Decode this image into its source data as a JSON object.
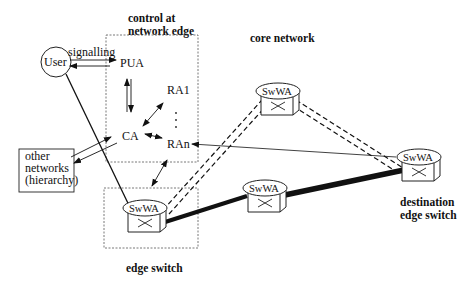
{
  "diagram": {
    "title_control": [
      "control at",
      "network edge"
    ],
    "core_label": "core network",
    "edge_switch_label": "edge switch",
    "destination_label": [
      "destination",
      "edge switch"
    ],
    "user": "User",
    "signalling": "signalling",
    "pua": "PUA",
    "ca": "CA",
    "ra1": "RA1",
    "ran": "RAn",
    "other_networks": [
      "other",
      "networks",
      "(hierarchy)"
    ],
    "switch_label": "SwWA",
    "colors": {
      "line": "#111111",
      "dashed_box": "#555555",
      "background": "#ffffff"
    }
  }
}
